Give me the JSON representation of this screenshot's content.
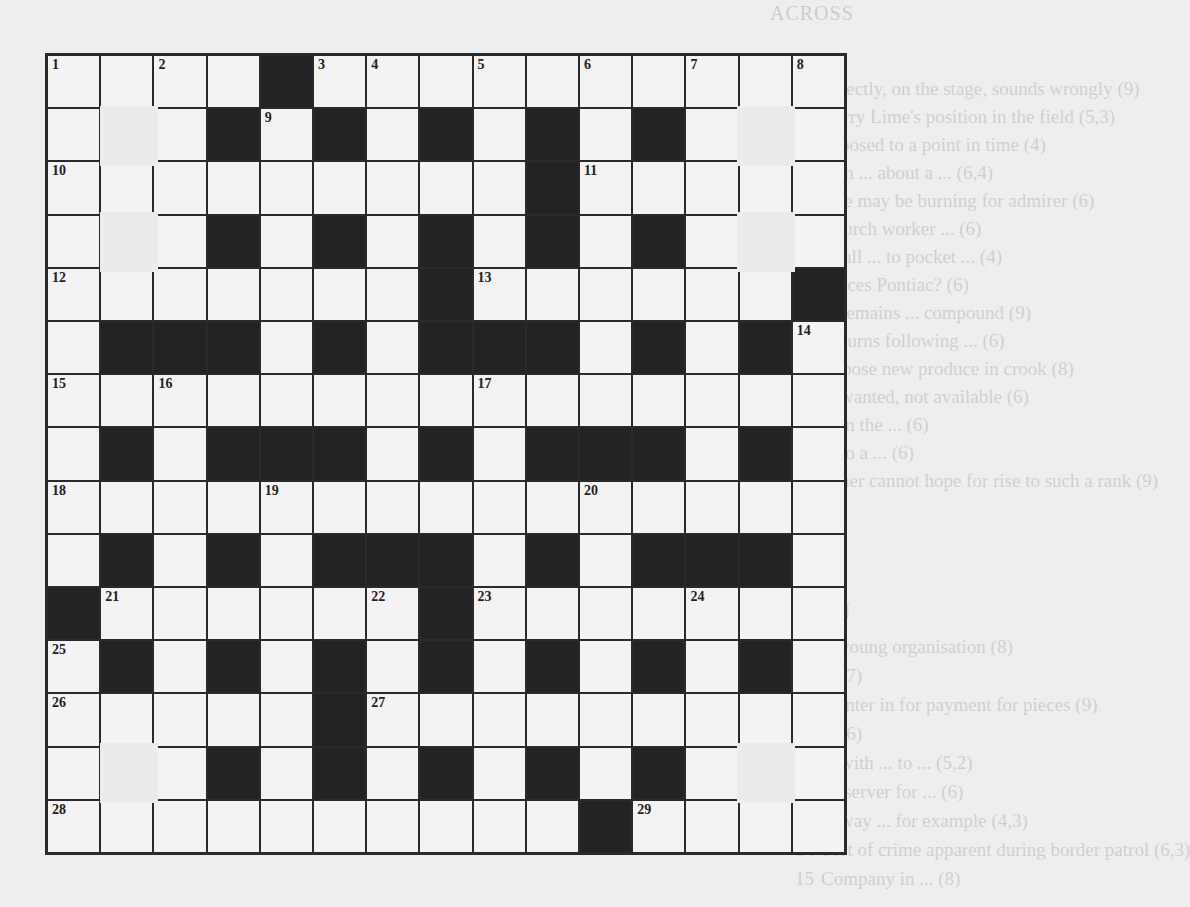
{
  "crossword": {
    "size": 15,
    "grid": [
      "....#..........",
      "...#.#.#.#.#...",
      ".........#.....",
      "...#.#.#.#.#...",
      ".......#......#",
      ".###.#.###.#.#.",
      "...............",
      ".#.###.#.###.#.",
      "...............",
      ".#.#.###.#.###.",
      "#......#.......",
      ".#.#.#.#.#.#.#.",
      ".....#.........",
      "...#.#.#.#.#...",
      "..........#...."
    ],
    "numbers": [
      {
        "n": "1",
        "r": 0,
        "c": 0
      },
      {
        "n": "2",
        "r": 0,
        "c": 2
      },
      {
        "n": "3",
        "r": 0,
        "c": 5
      },
      {
        "n": "4",
        "r": 0,
        "c": 6
      },
      {
        "n": "5",
        "r": 0,
        "c": 8
      },
      {
        "n": "6",
        "r": 0,
        "c": 10
      },
      {
        "n": "7",
        "r": 0,
        "c": 12
      },
      {
        "n": "8",
        "r": 0,
        "c": 14
      },
      {
        "n": "9",
        "r": 1,
        "c": 4
      },
      {
        "n": "10",
        "r": 2,
        "c": 0
      },
      {
        "n": "11",
        "r": 2,
        "c": 10
      },
      {
        "n": "12",
        "r": 4,
        "c": 0
      },
      {
        "n": "13",
        "r": 4,
        "c": 8
      },
      {
        "n": "14",
        "r": 5,
        "c": 14
      },
      {
        "n": "15",
        "r": 6,
        "c": 0
      },
      {
        "n": "16",
        "r": 6,
        "c": 2
      },
      {
        "n": "17",
        "r": 6,
        "c": 8
      },
      {
        "n": "18",
        "r": 8,
        "c": 0
      },
      {
        "n": "19",
        "r": 8,
        "c": 4
      },
      {
        "n": "20",
        "r": 8,
        "c": 10
      },
      {
        "n": "21",
        "r": 10,
        "c": 1
      },
      {
        "n": "22",
        "r": 10,
        "c": 6
      },
      {
        "n": "23",
        "r": 10,
        "c": 8
      },
      {
        "n": "24",
        "r": 10,
        "c": 12
      },
      {
        "n": "25",
        "r": 11,
        "c": 0
      },
      {
        "n": "26",
        "r": 12,
        "c": 0
      },
      {
        "n": "27",
        "r": 12,
        "c": 6
      },
      {
        "n": "28",
        "r": 14,
        "c": 0
      },
      {
        "n": "29",
        "r": 14,
        "c": 11
      }
    ],
    "patches": [
      {
        "r": 1,
        "c": 1
      },
      {
        "r": 3,
        "c": 1
      },
      {
        "r": 13,
        "c": 1
      },
      {
        "r": 1,
        "c": 13
      },
      {
        "r": 3,
        "c": 13
      },
      {
        "r": 13,
        "c": 13
      }
    ]
  },
  "showthrough": {
    "across_heading": "ACROSS",
    "down_heading": "DOWN",
    "across": [
      {
        "num": "1",
        "text": "Directly, on the stage, sounds wrongly (9)"
      },
      {
        "num": "5",
        "text": "Harry Lime's position in the field (5,3)"
      },
      {
        "num": "9",
        "text": "opposed to a point in time (4)"
      },
      {
        "num": "10",
        "text": "man ... about a ... (6,4)"
      },
      {
        "num": "11",
        "text": "One may be burning for admirer (6)"
      },
      {
        "num": "12",
        "text": "Church worker ... (6)"
      },
      {
        "num": "13",
        "text": "small ... to pocket ... (4)"
      },
      {
        "num": "",
        "text": "Forces Pontiac? (6)"
      },
      {
        "num": "19",
        "text": "... remains ... compound (9)"
      },
      {
        "num": "20",
        "text": "Returns following ... (6)"
      },
      {
        "num": "21",
        "text": "Expose new produce in crook (8)"
      },
      {
        "num": "22",
        "text": "unwanted, not available (6)"
      },
      {
        "num": "23",
        "text": "... in the ... (6)"
      },
      {
        "num": "24",
        "text": "... to a ... (6)"
      },
      {
        "num": "25",
        "text": "Other cannot hope for rise to such a rank (9)"
      }
    ],
    "down": [
      {
        "num": "2",
        "text": "... young organisation (8)"
      },
      {
        "num": "3",
        "text": "... (7)"
      },
      {
        "num": "4",
        "text": "Painter in for payment for pieces (9)"
      },
      {
        "num": "5",
        "text": "... (6)"
      },
      {
        "num": "6",
        "text": "... with ... to ... (5,2)"
      },
      {
        "num": "7",
        "text": "Observer for ... (6)"
      },
      {
        "num": "8",
        "text": "... way ... for example (4,3)"
      },
      {
        "num": "14",
        "text": "Sort of crime apparent during border patrol (6,3)"
      },
      {
        "num": "15",
        "text": "Company in ... (8)"
      }
    ]
  }
}
